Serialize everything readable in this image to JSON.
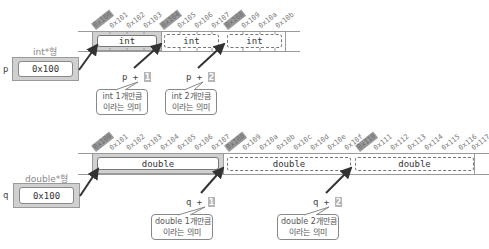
{
  "int_section": {
    "pointer": {
      "var": "p",
      "type_label": "int*형",
      "value": "0x100"
    },
    "addresses": [
      "0x100",
      "0x101",
      "0x102",
      "0x103",
      "0x104",
      "0x105",
      "0x106",
      "0x107",
      "0x108",
      "0x109",
      "0x10a",
      "0x10b"
    ],
    "highlighted": [
      "0x100",
      "0x104",
      "0x108"
    ],
    "cells": [
      "int",
      "int",
      "int"
    ],
    "expressions": [
      {
        "base": "p +",
        "n": "1",
        "callout_line1": "int 1개만큼",
        "callout_line2": "이라는 의미"
      },
      {
        "base": "p +",
        "n": "2",
        "callout_line1": "int 2개만큼",
        "callout_line2": "이라는 의미"
      }
    ]
  },
  "double_section": {
    "pointer": {
      "var": "q",
      "type_label": "double*형",
      "value": "0x100"
    },
    "addresses": [
      "0x100",
      "0x101",
      "0x102",
      "0x103",
      "0x104",
      "0x105",
      "0x106",
      "0x107",
      "0x108",
      "0x109",
      "0x10a",
      "0x10b",
      "0x10c",
      "0x10d",
      "0x10e",
      "0x10f",
      "0x110",
      "0x111",
      "0x112",
      "0x113",
      "0x114",
      "0x115",
      "0x116",
      "0x117"
    ],
    "highlighted": [
      "0x100",
      "0x108",
      "0x110"
    ],
    "cells": [
      "double",
      "double",
      "double"
    ],
    "expressions": [
      {
        "base": "q +",
        "n": "1",
        "callout_line1": "double 1개만큼",
        "callout_line2": "이라는 의미"
      },
      {
        "base": "q +",
        "n": "2",
        "callout_line1": "double 2개만큼",
        "callout_line2": "이라는 의미"
      }
    ]
  }
}
